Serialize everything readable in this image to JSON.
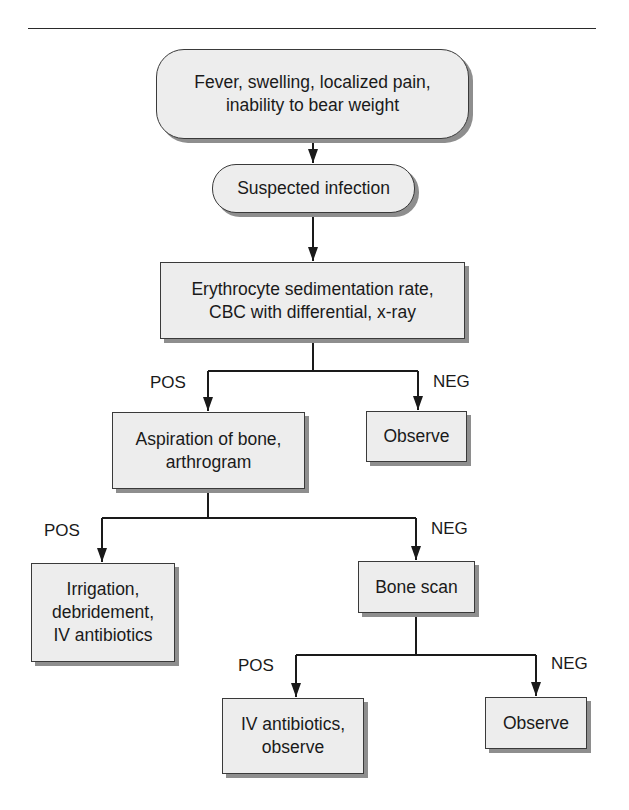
{
  "diagram": {
    "type": "flowchart",
    "nodes": {
      "symptoms": "Fever, swelling, localized pain,\ninability to bear weight",
      "suspected": "Suspected infection",
      "labs": "Erythrocyte sedimentation rate,\nCBC with differential, x-ray",
      "aspiration": "Aspiration of bone,\narthrogram",
      "observe1": "Observe",
      "irrigation": "Irrigation,\ndebridement,\nIV antibiotics",
      "bonescan": "Bone scan",
      "ivabx": "IV antibiotics,\nobserve",
      "observe2": "Observe"
    },
    "edge_labels": {
      "labs_pos": "POS",
      "labs_neg": "NEG",
      "asp_pos": "POS",
      "asp_neg": "NEG",
      "scan_pos": "POS",
      "scan_neg": "NEG"
    },
    "edges": [
      {
        "from": "symptoms",
        "to": "suspected"
      },
      {
        "from": "suspected",
        "to": "labs"
      },
      {
        "from": "labs",
        "to": "aspiration",
        "label": "POS"
      },
      {
        "from": "labs",
        "to": "observe1",
        "label": "NEG"
      },
      {
        "from": "aspiration",
        "to": "irrigation",
        "label": "POS"
      },
      {
        "from": "aspiration",
        "to": "bonescan",
        "label": "NEG"
      },
      {
        "from": "bonescan",
        "to": "ivabx",
        "label": "POS"
      },
      {
        "from": "bonescan",
        "to": "observe2",
        "label": "NEG"
      }
    ],
    "colors": {
      "box_fill": "#ededed",
      "box_border": "#3a3a3a",
      "shadow": "#8e8e8e",
      "line": "#1a1a1a"
    }
  }
}
